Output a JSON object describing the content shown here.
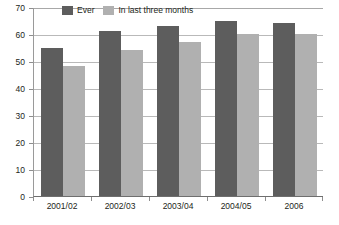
{
  "chart_data": {
    "type": "bar",
    "title": "",
    "subtitle": "",
    "xlabel": "",
    "ylabel": "",
    "categories": [
      "2001/02",
      "2002/03",
      "2003/04",
      "2004/05",
      "2006"
    ],
    "series": [
      {
        "name": "Ever",
        "color": "#5d5d5d",
        "values": [
          55,
          61,
          63,
          65,
          64
        ]
      },
      {
        "name": "In last three months",
        "color": "#b0b0b0",
        "values": [
          48,
          54,
          57,
          60,
          60
        ]
      }
    ],
    "ylim": [
      0,
      70
    ],
    "ytick_step": 10,
    "yticks": [
      0,
      10,
      20,
      30,
      40,
      50,
      60,
      70
    ],
    "ytick_labels": [
      "0",
      "10",
      "20",
      "30",
      "40",
      "50",
      "60",
      "70"
    ],
    "grid": "horizontal",
    "legend_position": "top-left-inside",
    "axis_color": "#8e8e8e",
    "grid_color": "#b9b9b9",
    "background": "#ffffff"
  },
  "legend": {
    "items": [
      {
        "label": "Ever",
        "swatch": "ever"
      },
      {
        "label": "In last three months",
        "swatch": "recent"
      }
    ]
  },
  "caption": {
    "text": ""
  }
}
